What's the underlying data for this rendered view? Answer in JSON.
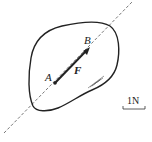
{
  "diagram": {
    "point_a_label": "A",
    "point_b_label": "B",
    "force_label": "F",
    "scale_label": "1N",
    "colors": {
      "stroke": "#222222",
      "dashed": "#555555",
      "hatch": "#555555"
    }
  }
}
